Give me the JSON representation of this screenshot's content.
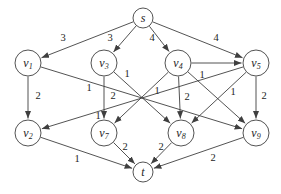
{
  "diagram": {
    "type": "directed-weighted-graph",
    "background_color": "#ffffff",
    "stroke_color": "#3f3f3f",
    "text_color": "#1e1e1e",
    "nodes": [
      {
        "id": "s",
        "label": "s",
        "sub": "",
        "x": 143,
        "y": 18,
        "r": 10
      },
      {
        "id": "v1",
        "label": "v",
        "sub": "1",
        "x": 28,
        "y": 63,
        "r": 13
      },
      {
        "id": "v3",
        "label": "v",
        "sub": "3",
        "x": 104,
        "y": 63,
        "r": 13
      },
      {
        "id": "v4",
        "label": "v",
        "sub": "4",
        "x": 178,
        "y": 63,
        "r": 13
      },
      {
        "id": "v5",
        "label": "v",
        "sub": "5",
        "x": 256,
        "y": 63,
        "r": 13
      },
      {
        "id": "v2",
        "label": "v",
        "sub": "2",
        "x": 28,
        "y": 133,
        "r": 13
      },
      {
        "id": "v7",
        "label": "v",
        "sub": "7",
        "x": 104,
        "y": 133,
        "r": 13
      },
      {
        "id": "v8",
        "label": "v",
        "sub": "8",
        "x": 181,
        "y": 133,
        "r": 13
      },
      {
        "id": "v9",
        "label": "v",
        "sub": "9",
        "x": 256,
        "y": 133,
        "r": 13
      },
      {
        "id": "t",
        "label": "t",
        "sub": "",
        "x": 143,
        "y": 172,
        "r": 10
      }
    ],
    "edges": [
      {
        "from": "s",
        "to": "v1",
        "weight": "3",
        "lx": 63,
        "ly": 41
      },
      {
        "from": "s",
        "to": "v3",
        "weight": "3",
        "lx": 110,
        "ly": 41
      },
      {
        "from": "s",
        "to": "v4",
        "weight": "4",
        "lx": 152,
        "ly": 41
      },
      {
        "from": "s",
        "to": "v5",
        "weight": "4",
        "lx": 216,
        "ly": 41
      },
      {
        "from": "v1",
        "to": "v2",
        "weight": "2",
        "lx": 38,
        "ly": 99
      },
      {
        "from": "v3",
        "to": "v7",
        "weight": "2",
        "lx": 113,
        "ly": 99
      },
      {
        "from": "v4",
        "to": "v8",
        "weight": "2",
        "lx": 187,
        "ly": 100
      },
      {
        "from": "v5",
        "to": "v9",
        "weight": "2",
        "lx": 264,
        "ly": 99
      },
      {
        "from": "v1",
        "to": "v9",
        "weight": "1",
        "lx": 89,
        "ly": 91
      },
      {
        "from": "v3",
        "to": "v8",
        "weight": "1",
        "lx": 127,
        "ly": 77
      },
      {
        "from": "v4",
        "to": "v7",
        "weight": "1",
        "lx": 157,
        "ly": 94
      },
      {
        "from": "v5",
        "to": "v2",
        "weight": "1",
        "lx": 98,
        "ly": 119
      },
      {
        "from": "v4",
        "to": "v9",
        "weight": "1",
        "lx": 202,
        "ly": 78
      },
      {
        "from": "v5",
        "to": "v8",
        "weight": "1",
        "lx": 233,
        "ly": 95
      },
      {
        "from": "v4",
        "to": "v5",
        "weight": "",
        "lx": 0,
        "ly": 0
      },
      {
        "from": "v2",
        "to": "t",
        "weight": "1",
        "lx": 77,
        "ly": 162
      },
      {
        "from": "v7",
        "to": "t",
        "weight": "2",
        "lx": 125,
        "ly": 150
      },
      {
        "from": "v8",
        "to": "t",
        "weight": "2",
        "lx": 161,
        "ly": 150
      },
      {
        "from": "v9",
        "to": "t",
        "weight": "2",
        "lx": 213,
        "ly": 161
      }
    ]
  }
}
